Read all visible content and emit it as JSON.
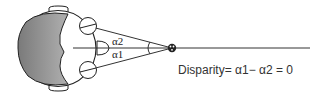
{
  "diagram": {
    "type": "binocular-disparity",
    "labels": {
      "angle_upper": "α2",
      "angle_lower": "α1"
    },
    "caption": "Disparity= α1− α2 = 0",
    "colors": {
      "stroke": "#222222",
      "brain_fill": "#8c8c8c",
      "background": "#ffffff"
    }
  }
}
